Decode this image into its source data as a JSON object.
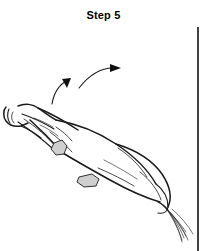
{
  "figure": {
    "title": "Step 5",
    "kind": "line-drawing-instructional-illustration",
    "background_color": "#ffffff",
    "ink_color": "#1a1a1a",
    "knot_fill_color": "#cfcfcf",
    "arrow_color": "#111111"
  },
  "annotations": {
    "arrow_lower": {
      "name": "motion-arrow-lower",
      "direction": "curving up and to the right",
      "path": "M 52 104 C 54 92 60 84 68 80",
      "head_points": "68,80 62,82 67,88"
    },
    "arrow_upper": {
      "name": "motion-arrow-upper",
      "direction": "curving up and to the right",
      "path": "M 79 88 C 90 74 102 68 113 68",
      "head_points": "119,68 110,64 110,72"
    }
  },
  "border": {
    "name": "vertical-rule",
    "x": 198,
    "y_top": 27,
    "y_bottom": 251
  },
  "drawing": {
    "muzzle_outline": "M 6 107 C 3 110 3 117 6 121 C 9 125 15 127 21 126 L 28 123",
    "muzzle_bridge": "M 9 109 C 7 113 7 119 10 123",
    "muzzle_nostril": "M 13 112 C 11 115 11 120 14 123",
    "head_top": "M 18 106 C 25 103 33 104 38 108 C 44 112 50 117 56 120",
    "head_cheek": "M 21 126 C 28 129 35 133 41 138",
    "halter_strap_upper": "M 22 114 C 34 118 44 123 54 129",
    "halter_strap_lower": "M 18 122 C 30 130 42 139 52 148",
    "neck_line_top": "M 38 108 C 52 114 66 122 78 130",
    "neck_line_bottom": "M 30 120 C 40 129 50 139 58 148",
    "rope_to_knot": "M 24 119 C 36 127 48 137 56 147",
    "body_top": "M 56 120 C 78 124 98 132 116 144 C 134 156 148 170 156 184",
    "body_back_curve": "M 116 144 C 136 150 152 160 162 174 C 170 186 172 198 168 207",
    "body_belly": "M 58 150 C 74 160 92 170 110 180 C 128 190 146 198 160 202",
    "body_rear": "M 156 184 C 164 190 168 198 168 207 C 167 212 163 214 158 213",
    "hindquarter_inner": "M 140 172 C 150 180 158 190 161 200",
    "chest_line": "M 50 132 C 58 138 66 145 72 152",
    "shoulder_crease": "M 56 127 C 62 131 68 136 72 141",
    "interior_shade_1": "M 98 168 C 112 174 124 180 134 186",
    "interior_shade_2": "M 104 160 C 116 166 128 173 137 179",
    "interior_shade_3": "M 34 118 C 42 121 48 124 53 127",
    "interior_shade_4": "M 40 125 C 47 128 53 132 58 136",
    "flank_curve": "M 118 148 C 130 156 140 166 147 177",
    "tail_base": "M 158 202 C 162 204 166 207 168 210",
    "tail_strands": [
      "M 160 203 C 168 210 178 220 186 232",
      "M 162 204 C 170 212 179 223 186 236",
      "M 164 206 C 171 214 179 225 184 238",
      "M 166 208 C 172 217 178 228 182 240",
      "M 168 210 C 174 219 179 229 182 242",
      "M 170 212 C 177 220 184 230 188 240",
      "M 172 209 C 180 216 188 225 193 234"
    ],
    "knots": [
      {
        "name": "knot-foreleg",
        "points": "54,143 62,140 67,146 64,154 56,155 51,149"
      },
      {
        "name": "knot-belly",
        "points": "79,177 92,174 99,179 96,186 84,187 77,182"
      }
    ]
  }
}
